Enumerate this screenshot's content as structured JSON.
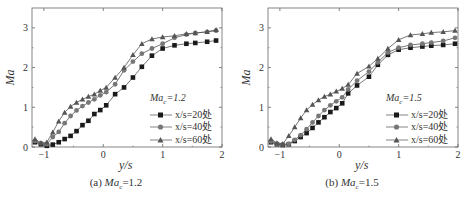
{
  "chart_data": [
    {
      "type": "line",
      "title": "",
      "caption": "(a) Ma_c=1.2",
      "caption_prefix": "(a) ",
      "caption_var": "Ma",
      "caption_sub": "c",
      "caption_value": "=1.2",
      "xlabel": "y/s",
      "ylabel": "Ma",
      "xlim": [
        -1.2,
        2
      ],
      "ylim": [
        0,
        3.5
      ],
      "xticks": [
        -1,
        0,
        1,
        2
      ],
      "yticks": [
        0,
        1,
        2,
        3
      ],
      "grid": false,
      "legend_position": "lower right",
      "legend_title": "Ma_c=1.2",
      "legend_title_var": "Ma",
      "legend_title_sub": "c",
      "legend_title_value": "=1.2",
      "series": [
        {
          "name": "x/s=20处",
          "marker": "square",
          "color": "#1a1a1a",
          "x": [
            -1.15,
            -1.05,
            -0.95,
            -0.85,
            -0.75,
            -0.65,
            -0.55,
            -0.45,
            -0.35,
            -0.25,
            -0.15,
            -0.05,
            0.05,
            0.2,
            0.35,
            0.5,
            0.65,
            0.82,
            1.0,
            1.2,
            1.4,
            1.55,
            1.75,
            1.9
          ],
          "values": [
            0.12,
            0.07,
            0.03,
            0.06,
            0.12,
            0.2,
            0.28,
            0.4,
            0.55,
            0.66,
            0.83,
            0.93,
            1.05,
            1.33,
            1.5,
            1.75,
            2.02,
            2.3,
            2.48,
            2.56,
            2.6,
            2.62,
            2.65,
            2.68
          ]
        },
        {
          "name": "x/s=40处",
          "marker": "circle",
          "color": "#777777",
          "x": [
            -1.15,
            -1.05,
            -0.95,
            -0.85,
            -0.75,
            -0.65,
            -0.55,
            -0.45,
            -0.35,
            -0.25,
            -0.15,
            -0.05,
            0.05,
            0.2,
            0.35,
            0.5,
            0.65,
            0.82,
            1.0,
            1.2,
            1.4,
            1.55,
            1.75,
            1.9
          ],
          "values": [
            0.15,
            0.1,
            0.07,
            0.25,
            0.38,
            0.6,
            0.78,
            0.92,
            1.03,
            1.12,
            1.2,
            1.3,
            1.38,
            1.58,
            1.93,
            2.15,
            2.35,
            2.48,
            2.6,
            2.75,
            2.83,
            2.87,
            2.9,
            2.93
          ]
        },
        {
          "name": "x/s=60处",
          "marker": "triangle",
          "color": "#555555",
          "x": [
            -1.15,
            -1.05,
            -0.95,
            -0.85,
            -0.75,
            -0.65,
            -0.55,
            -0.45,
            -0.35,
            -0.25,
            -0.15,
            -0.05,
            0.05,
            0.2,
            0.35,
            0.5,
            0.65,
            0.82,
            1.0,
            1.2,
            1.4,
            1.55,
            1.75,
            1.9
          ],
          "values": [
            0.2,
            0.1,
            0.12,
            0.37,
            0.65,
            0.87,
            1.02,
            1.12,
            1.2,
            1.27,
            1.33,
            1.42,
            1.5,
            1.75,
            2.0,
            2.32,
            2.6,
            2.72,
            2.77,
            2.8,
            2.85,
            2.87,
            2.9,
            2.95
          ]
        }
      ]
    },
    {
      "type": "line",
      "title": "",
      "caption": "(b) Ma_c=1.5",
      "caption_prefix": "(b) ",
      "caption_var": "Ma",
      "caption_sub": "c",
      "caption_value": "=1.5",
      "xlabel": "y/s",
      "ylabel": "Ma",
      "xlim": [
        -1.2,
        2
      ],
      "ylim": [
        0,
        3.5
      ],
      "xticks": [
        -1,
        0,
        1,
        2
      ],
      "yticks": [
        0,
        1,
        2,
        3
      ],
      "grid": false,
      "legend_position": "lower right",
      "legend_title": "Ma_c=1.5",
      "legend_title_var": "Ma",
      "legend_title_sub": "c",
      "legend_title_value": "=1.5",
      "series": [
        {
          "name": "x/s=20处",
          "marker": "square",
          "color": "#1a1a1a",
          "x": [
            -1.15,
            -1.05,
            -0.95,
            -0.85,
            -0.75,
            -0.65,
            -0.55,
            -0.45,
            -0.35,
            -0.25,
            -0.15,
            -0.05,
            0.05,
            0.15,
            0.3,
            0.5,
            0.65,
            0.82,
            1.0,
            1.2,
            1.4,
            1.55,
            1.75,
            1.95
          ],
          "values": [
            0.12,
            0.07,
            0.05,
            0.07,
            0.15,
            0.25,
            0.35,
            0.48,
            0.62,
            0.75,
            0.88,
            0.98,
            1.1,
            1.35,
            1.55,
            1.77,
            2.07,
            2.32,
            2.45,
            2.5,
            2.53,
            2.55,
            2.57,
            2.6
          ]
        },
        {
          "name": "x/s=40处",
          "marker": "circle",
          "color": "#777777",
          "x": [
            -1.15,
            -1.05,
            -0.95,
            -0.85,
            -0.75,
            -0.65,
            -0.55,
            -0.45,
            -0.35,
            -0.25,
            -0.15,
            -0.05,
            0.05,
            0.15,
            0.3,
            0.5,
            0.65,
            0.82,
            1.0,
            1.2,
            1.4,
            1.55,
            1.75,
            1.95
          ],
          "values": [
            0.14,
            0.08,
            0.06,
            0.08,
            0.18,
            0.3,
            0.45,
            0.62,
            0.78,
            0.93,
            1.05,
            1.15,
            1.25,
            1.45,
            1.67,
            1.9,
            2.13,
            2.38,
            2.5,
            2.57,
            2.6,
            2.63,
            2.67,
            2.75
          ]
        },
        {
          "name": "x/s=60处",
          "marker": "triangle",
          "color": "#555555",
          "x": [
            -1.15,
            -1.05,
            -0.95,
            -0.85,
            -0.75,
            -0.65,
            -0.55,
            -0.45,
            -0.35,
            -0.25,
            -0.15,
            -0.05,
            0.05,
            0.15,
            0.3,
            0.5,
            0.65,
            0.82,
            1.0,
            1.2,
            1.4,
            1.55,
            1.75,
            1.95
          ],
          "values": [
            0.2,
            0.1,
            0.08,
            0.28,
            0.5,
            0.73,
            0.93,
            1.07,
            1.18,
            1.27,
            1.33,
            1.4,
            1.47,
            1.57,
            1.85,
            2.03,
            2.23,
            2.48,
            2.7,
            2.82,
            2.85,
            2.88,
            2.9,
            2.93
          ]
        }
      ]
    }
  ]
}
